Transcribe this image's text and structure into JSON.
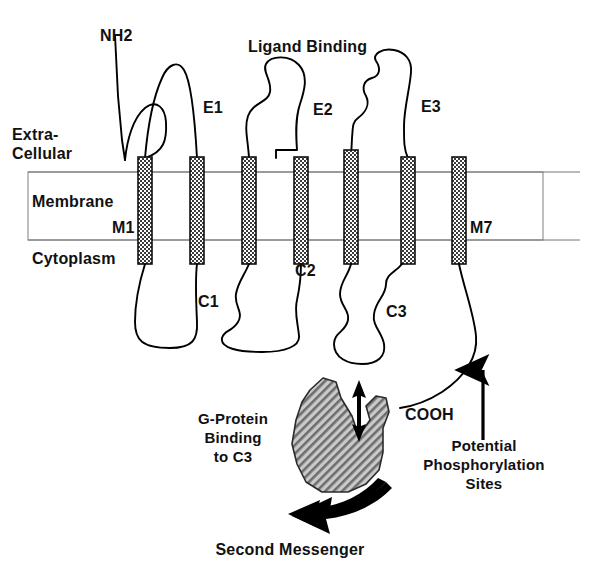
{
  "figure": {
    "kind": "schematic-diagram",
    "background_color": "#ffffff",
    "ink_color": "#000000",
    "helix_fill_color": "#6e6e6e",
    "gprotein_fill_color": "#9a9a9a"
  },
  "labels": {
    "nh2": "NH2",
    "ligand_binding": "Ligand Binding",
    "extracellular_line1": "Extra-",
    "extracellular_line2": "Cellular",
    "membrane": "Membrane",
    "cytoplasm": "Cytoplasm",
    "cooh": "COOH",
    "potential_line1": "Potential",
    "potential_line2": "Phosphorylation",
    "potential_line3": "Sites",
    "gprotein_line1": "G-Protein",
    "gprotein_line2": "Binding",
    "gprotein_line3": "to C3",
    "second_messenger": "Second Messenger"
  },
  "helices": [
    {
      "id": "M1",
      "label": "M1",
      "label_shown": true,
      "center_x": 145
    },
    {
      "id": "M2",
      "label": "M2",
      "label_shown": false,
      "center_x": 197
    },
    {
      "id": "M3",
      "label": "M3",
      "label_shown": false,
      "center_x": 249
    },
    {
      "id": "M4",
      "label": "M4",
      "label_shown": false,
      "center_x": 301
    },
    {
      "id": "M5",
      "label": "M5",
      "label_shown": false,
      "center_x": 351
    },
    {
      "id": "M6",
      "label": "M6",
      "label_shown": false,
      "center_x": 408
    },
    {
      "id": "M7",
      "label": "M7",
      "label_shown": true,
      "center_x": 459
    }
  ],
  "extracellular_loops": [
    {
      "id": "E1",
      "label": "E1"
    },
    {
      "id": "E2",
      "label": "E2"
    },
    {
      "id": "E3",
      "label": "E3"
    }
  ],
  "cytoplasmic_loops": [
    {
      "id": "C1",
      "label": "C1"
    },
    {
      "id": "C2",
      "label": "C2"
    },
    {
      "id": "C3",
      "label": "C3"
    }
  ],
  "membrane_band": {
    "left": 28,
    "right": 543,
    "top": 172,
    "bottom": 240
  },
  "arrows": {
    "double_headed": "double-headed-arrow-gprotein",
    "phosphorylation_pointer": "upward-arrow",
    "second_messenger": "curved-black-arrow"
  }
}
